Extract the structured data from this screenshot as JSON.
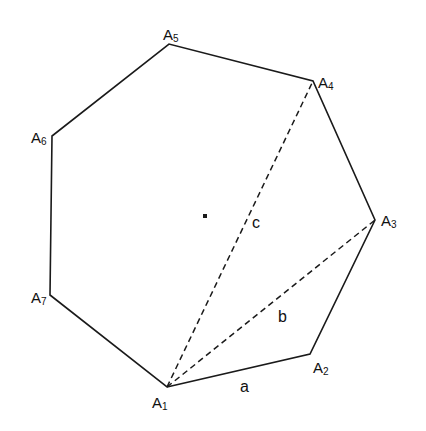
{
  "figure": {
    "stroke_color": "#1a1a1a",
    "vertices": [
      {
        "name": "A",
        "sub": "1",
        "x": 167,
        "y": 387,
        "lx": 152,
        "ly": 408
      },
      {
        "name": "A",
        "sub": "2",
        "x": 310,
        "y": 354,
        "lx": 313,
        "ly": 373
      },
      {
        "name": "A",
        "sub": "3",
        "x": 375,
        "y": 220,
        "lx": 381,
        "ly": 226
      },
      {
        "name": "A",
        "sub": "4",
        "x": 313,
        "y": 81,
        "lx": 318,
        "ly": 88
      },
      {
        "name": "A",
        "sub": "5",
        "x": 169,
        "y": 44,
        "lx": 163,
        "ly": 40
      },
      {
        "name": "A",
        "sub": "6",
        "x": 52,
        "y": 136,
        "lx": 31,
        "ly": 143
      },
      {
        "name": "A",
        "sub": "7",
        "x": 50,
        "y": 295,
        "lx": 31,
        "ly": 303
      }
    ],
    "center": {
      "x": 205,
      "y": 216
    },
    "segment_labels": {
      "a": {
        "text": "a",
        "x": 240,
        "y": 392
      },
      "b": {
        "text": "b",
        "x": 278,
        "y": 322
      },
      "c": {
        "text": "c",
        "x": 252,
        "y": 228
      }
    }
  }
}
